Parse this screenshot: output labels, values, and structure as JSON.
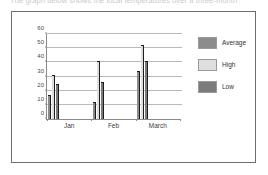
{
  "caption": {
    "text": "The graph below shows the local temperatures over a three-month period."
  },
  "legend": {
    "position": "right",
    "entries": [
      {
        "label": "Average",
        "color": "#8c8c8c",
        "swatch_name": "legend-swatch-average"
      },
      {
        "label": "High",
        "color": "#dedede",
        "swatch_name": "legend-swatch-high"
      },
      {
        "label": "Low",
        "color": "#7b7b7b",
        "swatch_name": "legend-swatch-low"
      }
    ]
  },
  "axes": {
    "y_ticks": [
      "0",
      "10",
      "20",
      "30",
      "40",
      "50",
      "60"
    ],
    "x_ticks": [
      "Jan",
      "Feb",
      "March"
    ]
  },
  "chart_data": {
    "type": "bar",
    "title": "",
    "subtitle": "",
    "xlabel": "",
    "ylabel": "",
    "categories": [
      "Jan",
      "Feb",
      "March"
    ],
    "series": [
      {
        "name": "Average",
        "color": "#8c8c8c",
        "values": [
          17,
          12,
          34
        ]
      },
      {
        "name": "High",
        "color": "#dedede",
        "values": [
          31,
          41,
          52
        ]
      },
      {
        "name": "Low",
        "color": "#7b7b7b",
        "values": [
          25,
          26,
          41
        ]
      }
    ],
    "ylim": [
      0,
      60
    ],
    "ytick_step": 10,
    "ytick_labels": [
      "0",
      "10",
      "20",
      "30",
      "40",
      "50",
      "60"
    ],
    "grid": true,
    "grid_axis": "y",
    "legend_position": "right",
    "bar_style": "grouped-with-drop-shadow"
  }
}
